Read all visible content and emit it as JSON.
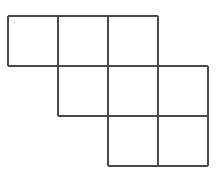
{
  "figure": {
    "canvas": {
      "width": 218,
      "height": 176,
      "background_color": "#ffffff"
    },
    "style": {
      "line_color": "#4a4a4a",
      "line_color_light": "#6e6e6e",
      "line_width": 2,
      "cell_fill": "#ffffff"
    },
    "geometry": {
      "cell_size": 50,
      "origin_x": 8,
      "origin_y": 16,
      "column_x": [
        8,
        58,
        108,
        158,
        208
      ],
      "row_y": [
        16,
        66,
        116,
        166
      ]
    },
    "rows": [
      {
        "name": "top-row",
        "row_index": 0,
        "y_top": 16,
        "y_bottom": 66,
        "x_start": 8,
        "x_end": 158,
        "cell_count": 3
      },
      {
        "name": "middle-row",
        "row_index": 1,
        "y_top": 66,
        "y_bottom": 116,
        "x_start": 58,
        "x_end": 208,
        "cell_count": 3
      },
      {
        "name": "bottom-row",
        "row_index": 2,
        "y_top": 116,
        "y_bottom": 166,
        "x_start": 108,
        "x_end": 208,
        "cell_count": 2
      }
    ],
    "cells": [
      {
        "id": "cell-r0c0",
        "row": 0,
        "col": 0,
        "x": 8,
        "y": 16,
        "w": 50,
        "h": 50
      },
      {
        "id": "cell-r0c1",
        "row": 0,
        "col": 1,
        "x": 58,
        "y": 16,
        "w": 50,
        "h": 50
      },
      {
        "id": "cell-r0c2",
        "row": 0,
        "col": 2,
        "x": 108,
        "y": 16,
        "w": 50,
        "h": 50
      },
      {
        "id": "cell-r1c1",
        "row": 1,
        "col": 1,
        "x": 58,
        "y": 66,
        "w": 50,
        "h": 50
      },
      {
        "id": "cell-r1c2",
        "row": 1,
        "col": 2,
        "x": 108,
        "y": 66,
        "w": 50,
        "h": 50
      },
      {
        "id": "cell-r1c3",
        "row": 1,
        "col": 3,
        "x": 158,
        "y": 66,
        "w": 50,
        "h": 50
      },
      {
        "id": "cell-r2c2",
        "row": 2,
        "col": 2,
        "x": 108,
        "y": 116,
        "w": 50,
        "h": 50
      },
      {
        "id": "cell-r2c3",
        "row": 2,
        "col": 3,
        "x": 158,
        "y": 116,
        "w": 50,
        "h": 50
      }
    ],
    "segments": [
      {
        "id": "seg-h-top-row0",
        "orientation": "horizontal",
        "x1": 8,
        "y1": 16,
        "x2": 158,
        "y2": 16
      },
      {
        "id": "seg-h-row0-row1",
        "orientation": "horizontal",
        "x1": 8,
        "y1": 66,
        "x2": 208,
        "y2": 66
      },
      {
        "id": "seg-h-row1-row2",
        "orientation": "horizontal",
        "x1": 58,
        "y1": 116,
        "x2": 208,
        "y2": 116
      },
      {
        "id": "seg-h-bottom-row2",
        "orientation": "horizontal",
        "x1": 108,
        "y1": 166,
        "x2": 208,
        "y2": 166
      },
      {
        "id": "seg-v-col0",
        "orientation": "vertical",
        "x1": 8,
        "y1": 16,
        "x2": 8,
        "y2": 66
      },
      {
        "id": "seg-v-col1",
        "orientation": "vertical",
        "x1": 58,
        "y1": 16,
        "x2": 58,
        "y2": 116
      },
      {
        "id": "seg-v-col2",
        "orientation": "vertical",
        "x1": 108,
        "y1": 16,
        "x2": 108,
        "y2": 166
      },
      {
        "id": "seg-v-col3",
        "orientation": "vertical",
        "x1": 158,
        "y1": 16,
        "x2": 158,
        "y2": 166
      },
      {
        "id": "seg-v-col4",
        "orientation": "vertical",
        "x1": 208,
        "y1": 66,
        "x2": 208,
        "y2": 166
      }
    ],
    "totals": {
      "square_count": 8,
      "row_count": 3,
      "column_count": 4
    }
  }
}
